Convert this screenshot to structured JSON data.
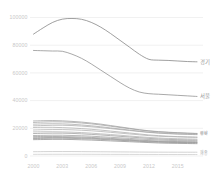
{
  "chart_data": {
    "type": "line",
    "title": "",
    "subtitle": "",
    "xlabel": "",
    "ylabel": "",
    "x": [
      2000,
      2001,
      2002,
      2003,
      2004,
      2005,
      2006,
      2007,
      2008,
      2009,
      2010,
      2011,
      2012,
      2013,
      2014,
      2015,
      2016,
      2017
    ],
    "xlim": [
      2000,
      2017
    ],
    "ylim": [
      0,
      100000
    ],
    "x_ticks": [
      "2000",
      "2003",
      "2006",
      "2009",
      "2012",
      "2015"
    ],
    "x_tick_values": [
      2000,
      2003,
      2006,
      2009,
      2012,
      2015
    ],
    "y_ticks": [
      "0",
      "20000",
      "40000",
      "60000",
      "80000",
      "100000"
    ],
    "y_tick_values": [
      0,
      20000,
      40000,
      60000,
      80000,
      100000
    ],
    "grid": true,
    "grid_axis": "y",
    "legend_position": "right-inline",
    "series": [
      {
        "name": "경기",
        "label": "경기",
        "color": "#808080",
        "values": [
          88000,
          92500,
          96500,
          98800,
          99300,
          98700,
          96500,
          93000,
          88500,
          83500,
          78500,
          73500,
          69800,
          69200,
          69000,
          68600,
          68200,
          68000
        ]
      },
      {
        "name": "서울",
        "label": "서울",
        "color": "#8c8c8c",
        "values": [
          76200,
          76000,
          75800,
          75600,
          73500,
          70500,
          66500,
          62000,
          57500,
          53000,
          49000,
          46200,
          45000,
          44600,
          44200,
          43800,
          43400,
          43000
        ]
      },
      {
        "name": "부산",
        "label": "부산",
        "color": "#9e9e9e",
        "values": [
          25300,
          25500,
          25600,
          25400,
          25000,
          24500,
          23800,
          23000,
          22000,
          21000,
          20000,
          19000,
          18200,
          17600,
          17200,
          16800,
          16500,
          16300
        ]
      },
      {
        "name": "경남",
        "label": "경남",
        "color": "#a3a3a3",
        "values": [
          24200,
          24500,
          24700,
          24600,
          24300,
          23800,
          23200,
          22400,
          21500,
          20600,
          19700,
          18800,
          18000,
          17400,
          17000,
          16700,
          16400,
          16200
        ]
      },
      {
        "name": "경북",
        "label": "경북",
        "color": "#a8a8a8",
        "values": [
          23000,
          23200,
          23300,
          23200,
          22900,
          22400,
          21800,
          21100,
          20300,
          19500,
          18700,
          17900,
          17200,
          16700,
          16300,
          16000,
          15800,
          15600
        ]
      },
      {
        "name": "인천",
        "label": "인천",
        "color": "#ababab",
        "values": [
          21800,
          22000,
          22200,
          22200,
          22000,
          21600,
          21100,
          20500,
          19800,
          19100,
          18400,
          17700,
          17000,
          16500,
          16100,
          15800,
          15600,
          15400
        ]
      },
      {
        "name": "전남",
        "label": "전남",
        "color": "#aeaeae",
        "values": [
          20600,
          20700,
          20700,
          20500,
          20200,
          19800,
          19300,
          18700,
          18000,
          17300,
          16600,
          15900,
          15200,
          14700,
          14300,
          14000,
          13800,
          13600
        ]
      },
      {
        "name": "충남",
        "label": "충남",
        "color": "#b0b0b0",
        "values": [
          18800,
          19000,
          19100,
          19100,
          18900,
          18600,
          18200,
          17700,
          17100,
          16500,
          15900,
          15300,
          14700,
          14300,
          14000,
          13800,
          13600,
          13500
        ]
      },
      {
        "name": "전북",
        "label": "전북",
        "color": "#b2b2b2",
        "values": [
          17400,
          17500,
          17500,
          17400,
          17200,
          16900,
          16500,
          16000,
          15500,
          15000,
          14400,
          13900,
          13400,
          13000,
          12700,
          12500,
          12300,
          12200
        ]
      },
      {
        "name": "대구",
        "label": "대구",
        "color": "#9c9c9c",
        "values": [
          16200,
          16400,
          16500,
          16500,
          16300,
          16000,
          15600,
          15200,
          14700,
          14200,
          13700,
          13200,
          12700,
          12300,
          12000,
          11800,
          11600,
          11500
        ]
      },
      {
        "name": "충북",
        "label": "충북",
        "color": "#a0a0a0",
        "values": [
          14800,
          14900,
          15000,
          15000,
          14800,
          14600,
          14300,
          13900,
          13500,
          13100,
          12700,
          12300,
          11900,
          11600,
          11300,
          11100,
          11000,
          10900
        ]
      },
      {
        "name": "강원",
        "label": "강원",
        "color": "#9a9a9a",
        "values": [
          14000,
          14100,
          14100,
          14000,
          13900,
          13700,
          13400,
          13100,
          12700,
          12300,
          11900,
          11500,
          11100,
          10800,
          10600,
          10400,
          10300,
          10200
        ]
      },
      {
        "name": "대전",
        "label": "대전",
        "color": "#979797",
        "values": [
          13200,
          13300,
          13400,
          13400,
          13300,
          13100,
          12800,
          12500,
          12200,
          11800,
          11400,
          11000,
          10700,
          10400,
          10200,
          10000,
          9900,
          9800
        ]
      },
      {
        "name": "광주",
        "label": "광주",
        "color": "#949494",
        "values": [
          12600,
          12700,
          12800,
          12800,
          12700,
          12500,
          12300,
          12000,
          11700,
          11300,
          11000,
          10600,
          10300,
          10000,
          9800,
          9700,
          9600,
          9500
        ]
      },
      {
        "name": "울산",
        "label": "울산",
        "color": "#8f8f8f",
        "values": [
          11800,
          11900,
          12000,
          12000,
          11900,
          11700,
          11500,
          11200,
          10900,
          10600,
          10300,
          10000,
          9700,
          9400,
          9200,
          9100,
          9000,
          8900
        ]
      },
      {
        "name": "제주",
        "label": "제주",
        "color": "#c4c4c4",
        "values": [
          3100,
          3150,
          3200,
          3200,
          3200,
          3150,
          3100,
          3050,
          3000,
          2950,
          2900,
          2850,
          2800,
          2780,
          2760,
          2750,
          2740,
          2730
        ]
      },
      {
        "name": "세종",
        "label": "세종",
        "color": "#cccccc",
        "values": [
          1200,
          1220,
          1240,
          1250,
          1250,
          1240,
          1220,
          1200,
          1180,
          1160,
          1140,
          1120,
          1100,
          1090,
          1080,
          1070,
          1060,
          1050
        ]
      }
    ],
    "inline_labels": [
      {
        "name": "경기",
        "text": "경기",
        "at_x": 2017,
        "at_y": 68000
      },
      {
        "name": "서울",
        "text": "서울",
        "at_x": 2017,
        "at_y": 43000
      },
      {
        "name": "부산",
        "text": "부산",
        "at_x": 2017,
        "at_y": 16300
      },
      {
        "name": "경남",
        "text": "경남",
        "at_x": 2017,
        "at_y": 16200
      },
      {
        "name": "경북",
        "text": "경북",
        "at_x": 2017,
        "at_y": 15600
      },
      {
        "name": "인천",
        "text": "인천",
        "at_x": 2017,
        "at_y": 15400
      },
      {
        "name": "제주",
        "text": "제주",
        "at_x": 2017,
        "at_y": 2730
      },
      {
        "name": "세종",
        "text": "세종",
        "at_x": 2017,
        "at_y": 1050
      }
    ],
    "axis_colors": {
      "gridline": "#ebebeb",
      "tick_label": "#c8c8c8",
      "series_label": "#9a9a9a",
      "background": "#ffffff"
    }
  }
}
